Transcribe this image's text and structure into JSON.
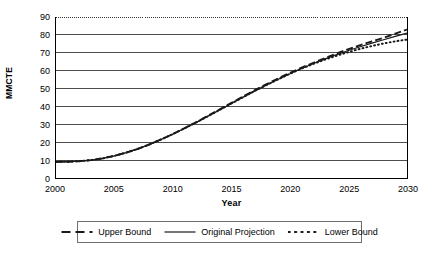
{
  "chart_data": {
    "type": "line",
    "title": "",
    "xlabel": "Year",
    "ylabel": "MMCTE",
    "xlim": [
      2000,
      2030
    ],
    "ylim": [
      0,
      90
    ],
    "grid": true,
    "grid_axis": "y",
    "legend_position": "bottom",
    "x_tick_labels": [
      "2000",
      "2005",
      "2010",
      "2015",
      "2020",
      "2025",
      "2030"
    ],
    "x_tick_values": [
      2000,
      2005,
      2010,
      2015,
      2020,
      2025,
      2030
    ],
    "x_minor_tick_interval": 1,
    "y_tick_labels": [
      "0",
      "10",
      "20",
      "30",
      "40",
      "50",
      "60",
      "70",
      "80",
      "90"
    ],
    "y_tick_values": [
      0,
      10,
      20,
      30,
      40,
      50,
      60,
      70,
      80,
      90
    ],
    "x": [
      2000,
      2001,
      2002,
      2003,
      2004,
      2005,
      2006,
      2007,
      2008,
      2009,
      2010,
      2011,
      2012,
      2013,
      2014,
      2015,
      2016,
      2017,
      2018,
      2019,
      2020,
      2021,
      2022,
      2023,
      2024,
      2025,
      2026,
      2027,
      2028,
      2029,
      2030
    ],
    "series": [
      {
        "name": "Upper Bound",
        "style": "dashed",
        "color": "#1a1a1a",
        "values": [
          9.0,
          9.1,
          9.4,
          10.0,
          11.0,
          12.4,
          14.2,
          16.3,
          18.8,
          21.6,
          24.6,
          27.9,
          31.3,
          34.8,
          38.4,
          42.0,
          45.6,
          49.1,
          52.5,
          55.7,
          58.8,
          61.7,
          64.4,
          67.0,
          69.6,
          72.1,
          74.3,
          76.4,
          78.4,
          80.7,
          83.0
        ]
      },
      {
        "name": "Original Projection",
        "style": "solid",
        "color": "#1a1a1a",
        "values": [
          9.0,
          9.1,
          9.4,
          10.0,
          11.0,
          12.4,
          14.2,
          16.3,
          18.8,
          21.6,
          24.6,
          27.8,
          31.1,
          34.6,
          38.1,
          41.7,
          45.2,
          48.7,
          52.0,
          55.2,
          58.3,
          61.2,
          64.0,
          66.6,
          69.0,
          71.3,
          73.4,
          75.4,
          77.3,
          79.2,
          81.0
        ]
      },
      {
        "name": "Lower Bound",
        "style": "dotted",
        "color": "#1a1a1a",
        "values": [
          9.0,
          9.1,
          9.4,
          10.0,
          11.0,
          12.4,
          14.2,
          16.3,
          18.8,
          21.6,
          24.6,
          27.8,
          31.1,
          34.6,
          38.1,
          41.7,
          45.2,
          48.7,
          52.0,
          55.2,
          58.3,
          61.2,
          63.8,
          66.2,
          68.4,
          70.4,
          72.2,
          73.8,
          75.2,
          76.4,
          77.4
        ]
      }
    ]
  },
  "legend": {
    "entries": [
      {
        "label": "Upper Bound",
        "style": "dashed"
      },
      {
        "label": "Original Projection",
        "style": "solid"
      },
      {
        "label": "Lower Bound",
        "style": "dotted"
      }
    ]
  }
}
